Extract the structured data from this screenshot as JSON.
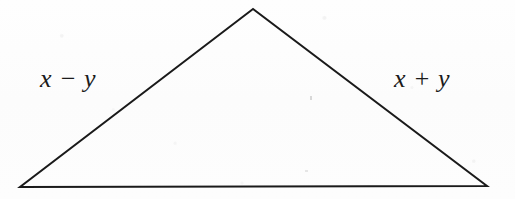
{
  "figure": {
    "canvas": {
      "width": 515,
      "height": 199
    },
    "background_color": "#fdfdfd",
    "stroke_color": "#1a1a1a",
    "stroke_width": 2,
    "text_color": "#1b1b1b",
    "shape": {
      "name": "triangle",
      "vertices": {
        "apex": {
          "x": 253,
          "y": 9
        },
        "bottom_left": {
          "x": 20,
          "y": 187
        },
        "bottom_right": {
          "x": 487,
          "y": 186
        }
      },
      "points": "253,9 20,187 487,186"
    },
    "labels": {
      "left": {
        "text": "x − y",
        "x": 80,
        "y": 80
      },
      "right": {
        "text": "x + y",
        "x": 433,
        "y": 80
      }
    }
  }
}
